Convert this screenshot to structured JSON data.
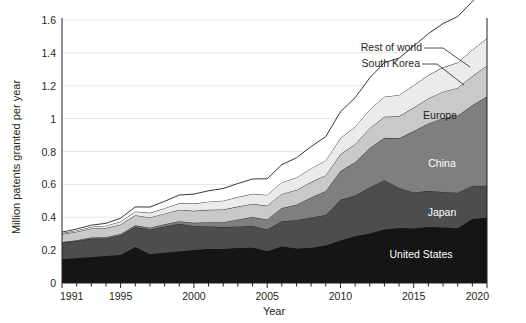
{
  "chart_data": {
    "type": "area",
    "stacked": true,
    "title": "",
    "subtitle": "",
    "xlabel": "Year",
    "ylabel": "Million patents granted per year",
    "xlim": [
      1991,
      2020
    ],
    "ylim": [
      0,
      1.6
    ],
    "xticks": [
      1991,
      1995,
      2000,
      2005,
      2010,
      2015,
      2020
    ],
    "xtick_labels": [
      "1991",
      "1995",
      "2000",
      "2005",
      "2010",
      "2015",
      "2020"
    ],
    "xtick_minor": [
      1992,
      1993,
      1994,
      1996,
      1997,
      1998,
      1999,
      2001,
      2002,
      2003,
      2004,
      2006,
      2007,
      2008,
      2009,
      2011,
      2012,
      2013,
      2014,
      2016,
      2017,
      2018,
      2019
    ],
    "yticks": [
      0,
      0.2,
      0.4,
      0.6,
      0.8,
      1,
      1.2,
      1.4,
      1.6
    ],
    "ytick_labels": [
      "0",
      "0.2",
      "0.4",
      "0.6",
      "0.8",
      "1",
      "1.2",
      "1.4",
      "1.6"
    ],
    "grid": true,
    "grid_axis": "y",
    "legend": "inline-labels",
    "x": [
      1991,
      1992,
      1993,
      1994,
      1995,
      1996,
      1997,
      1998,
      1999,
      2000,
      2001,
      2002,
      2003,
      2004,
      2005,
      2006,
      2007,
      2008,
      2009,
      2010,
      2011,
      2012,
      2013,
      2014,
      2015,
      2016,
      2017,
      2018,
      2019,
      2020
    ],
    "series": [
      {
        "name": "United States",
        "color": "#151515",
        "label_color": "#ffffff",
        "values": [
          0.146,
          0.152,
          0.159,
          0.166,
          0.172,
          0.221,
          0.176,
          0.185,
          0.193,
          0.203,
          0.209,
          0.208,
          0.214,
          0.216,
          0.195,
          0.224,
          0.211,
          0.215,
          0.23,
          0.26,
          0.286,
          0.303,
          0.327,
          0.336,
          0.333,
          0.342,
          0.339,
          0.335,
          0.391,
          0.399
        ]
      },
      {
        "name": "Japan",
        "color": "#4d4d4d",
        "label_color": "#ffffff",
        "values": [
          0.1,
          0.103,
          0.111,
          0.105,
          0.118,
          0.119,
          0.15,
          0.158,
          0.167,
          0.144,
          0.137,
          0.132,
          0.13,
          0.132,
          0.13,
          0.151,
          0.173,
          0.184,
          0.183,
          0.246,
          0.246,
          0.279,
          0.298,
          0.242,
          0.218,
          0.219,
          0.215,
          0.214,
          0.201,
          0.193
        ]
      },
      {
        "name": "China",
        "color": "#7f7f7f",
        "label_color": "#ffffff",
        "values": [
          0.004,
          0.005,
          0.007,
          0.007,
          0.008,
          0.011,
          0.01,
          0.014,
          0.016,
          0.019,
          0.024,
          0.03,
          0.043,
          0.053,
          0.062,
          0.081,
          0.092,
          0.121,
          0.147,
          0.175,
          0.202,
          0.24,
          0.258,
          0.302,
          0.374,
          0.41,
          0.449,
          0.468,
          0.489,
          0.542
        ]
      },
      {
        "name": "Europe",
        "color": "#c9c9c9",
        "label_color": "#231f20",
        "values": [
          0.048,
          0.052,
          0.055,
          0.057,
          0.058,
          0.061,
          0.063,
          0.065,
          0.07,
          0.073,
          0.075,
          0.077,
          0.078,
          0.08,
          0.083,
          0.086,
          0.09,
          0.094,
          0.096,
          0.102,
          0.11,
          0.12,
          0.128,
          0.134,
          0.142,
          0.152,
          0.161,
          0.17,
          0.178,
          0.188
        ]
      },
      {
        "name": "South Korea",
        "color": "#ebebeb",
        "label_color": "#231f20",
        "values": [
          0.006,
          0.008,
          0.01,
          0.014,
          0.018,
          0.023,
          0.028,
          0.033,
          0.039,
          0.044,
          0.05,
          0.054,
          0.058,
          0.062,
          0.066,
          0.07,
          0.076,
          0.083,
          0.09,
          0.099,
          0.107,
          0.114,
          0.122,
          0.13,
          0.136,
          0.142,
          0.148,
          0.154,
          0.16,
          0.167
        ]
      },
      {
        "name": "Rest of world",
        "color": "#ffffff",
        "label_color": "#231f20",
        "values": [
          0.006,
          0.008,
          0.01,
          0.014,
          0.02,
          0.028,
          0.035,
          0.042,
          0.05,
          0.058,
          0.066,
          0.074,
          0.082,
          0.09,
          0.098,
          0.108,
          0.12,
          0.133,
          0.145,
          0.16,
          0.176,
          0.192,
          0.208,
          0.224,
          0.238,
          0.252,
          0.266,
          0.28,
          0.294,
          0.311
        ]
      }
    ],
    "inline_labels": [
      {
        "name": "Europe",
        "x": 440,
        "y": 119
      },
      {
        "name": "China",
        "x": 442,
        "y": 167
      },
      {
        "name": "Japan",
        "x": 442,
        "y": 216
      },
      {
        "name": "United States",
        "x": 421,
        "y": 258
      }
    ],
    "callouts": [
      {
        "name": "Rest of world",
        "text_x": 422,
        "text_y": 51,
        "leader": [
          [
            424,
            48
          ],
          [
            443,
            48
          ],
          [
            470,
            67
          ]
        ]
      },
      {
        "name": "South Korea",
        "text_x": 420,
        "text_y": 67,
        "leader": [
          [
            422,
            64
          ],
          [
            437,
            64
          ],
          [
            464,
            85
          ]
        ]
      }
    ]
  }
}
